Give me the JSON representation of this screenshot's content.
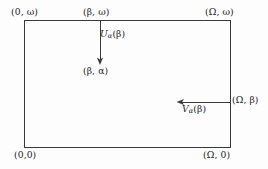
{
  "figure": {
    "type": "mathematical-diagram",
    "background_color": "#fdfdfd",
    "line_color": "#3a3a3a",
    "text_color": "#1b1b1b"
  },
  "rectangle": {
    "left_px": 24,
    "top_px": 20,
    "width_px": 207,
    "height_px": 128
  },
  "vertex_labels": {
    "top_left": "(0, ω)",
    "top_middle": "(β, ω)",
    "top_right": "(Ω, ω)",
    "bottom_left": "(0,0)",
    "bottom_right": "(Ω, 0)",
    "interior_point": "(β, α)",
    "right_edge_point": "(Ω, β)"
  },
  "arrows": [
    {
      "name": "u-arrow",
      "label_base": "U",
      "label_subscript": "α",
      "label_argument": "(β)",
      "label_full": "Uα(β)",
      "direction": "down",
      "from": {
        "x": 100,
        "y": 21
      },
      "to": {
        "x": 100,
        "y": 64
      }
    },
    {
      "name": "v-arrow",
      "label_base": "V",
      "label_subscript": "α",
      "label_argument": "(β)",
      "label_full": "Vα(β)",
      "direction": "left",
      "from": {
        "x": 231,
        "y": 102
      },
      "to": {
        "x": 177,
        "y": 102
      }
    }
  ]
}
